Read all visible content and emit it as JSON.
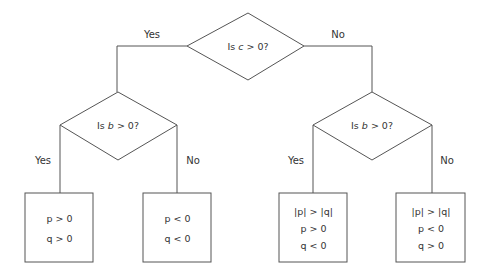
{
  "decisions": {
    "root": {
      "text": "Is c > 0?",
      "var": "c",
      "prefix": "Is",
      "suffix": "> 0?"
    },
    "left": {
      "text": "Is b > 0?",
      "var": "b",
      "prefix": "Is",
      "suffix": "> 0?"
    },
    "right": {
      "text": "Is b > 0?",
      "var": "b",
      "prefix": "Is",
      "suffix": "> 0?"
    }
  },
  "edges": {
    "root_yes": "Yes",
    "root_no": "No",
    "left_yes": "Yes",
    "left_no": "No",
    "right_yes": "Yes",
    "right_no": "No"
  },
  "outcomes": [
    {
      "lines": [
        "p > 0",
        "q > 0"
      ]
    },
    {
      "lines": [
        "p < 0",
        "q < 0"
      ]
    },
    {
      "lines": [
        "|p| > |q|",
        "p > 0",
        "q < 0"
      ]
    },
    {
      "lines": [
        "|p| > |q|",
        "p < 0",
        "q > 0"
      ]
    }
  ],
  "colors": {
    "stroke": "#555555",
    "text": "#333333",
    "background": "#ffffff"
  }
}
